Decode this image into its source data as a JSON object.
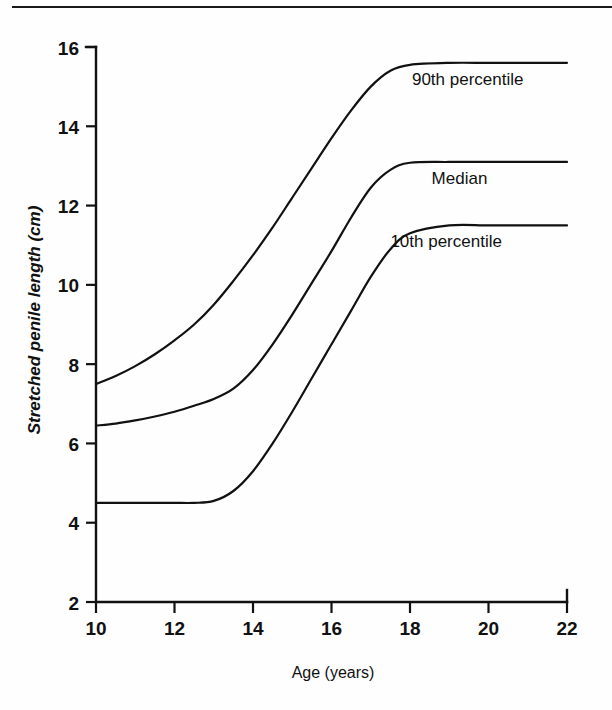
{
  "figure": {
    "background_color": "#fefefe",
    "ink_color": "#111111",
    "top_rule": true
  },
  "chart_data": {
    "type": "line",
    "title": "",
    "xlabel": "Age (years)",
    "ylabel": "Stretched penile length (cm)",
    "xlim": [
      10,
      22
    ],
    "ylim": [
      2,
      16
    ],
    "xticks": [
      10,
      12,
      14,
      16,
      18,
      20,
      22
    ],
    "yticks": [
      2,
      4,
      6,
      8,
      10,
      12,
      14,
      16
    ],
    "xtick_labels": [
      "10",
      "12",
      "14",
      "16",
      "18",
      "20",
      "22"
    ],
    "ytick_labels": [
      "2",
      "4",
      "6",
      "8",
      "10",
      "12",
      "14",
      "16"
    ],
    "grid": false,
    "legend_position": "inline-right-of-curves",
    "x": [
      10,
      10.5,
      11,
      11.5,
      12,
      12.5,
      13,
      13.5,
      14,
      14.5,
      15,
      15.5,
      16,
      16.5,
      17,
      17.5,
      18,
      19,
      20,
      21,
      22
    ],
    "series": [
      {
        "name": "90th percentile",
        "label": "90th percentile",
        "label_x": 18.05,
        "label_y": 15.05,
        "plateau_value": 15.6,
        "start_value": 7.5,
        "values": [
          7.5,
          7.7,
          7.95,
          8.25,
          8.6,
          9.0,
          9.5,
          10.1,
          10.75,
          11.45,
          12.2,
          12.95,
          13.7,
          14.4,
          15.0,
          15.4,
          15.55,
          15.6,
          15.6,
          15.6,
          15.6
        ]
      },
      {
        "name": "Median",
        "label": "Median",
        "label_x": 18.55,
        "label_y": 12.55,
        "plateau_value": 13.1,
        "start_value": 6.45,
        "values": [
          6.45,
          6.5,
          6.58,
          6.68,
          6.8,
          6.95,
          7.12,
          7.38,
          7.85,
          8.5,
          9.25,
          10.05,
          10.85,
          11.7,
          12.45,
          12.9,
          13.08,
          13.1,
          13.1,
          13.1,
          13.1
        ]
      },
      {
        "name": "10th percentile",
        "label": "10th percentile",
        "label_x": 17.5,
        "label_y": 10.95,
        "plateau_value": 11.5,
        "start_value": 4.5,
        "values": [
          4.5,
          4.5,
          4.5,
          4.5,
          4.5,
          4.5,
          4.55,
          4.8,
          5.3,
          6.0,
          6.8,
          7.65,
          8.5,
          9.35,
          10.2,
          10.9,
          11.3,
          11.5,
          11.5,
          11.5,
          11.5
        ]
      }
    ]
  }
}
